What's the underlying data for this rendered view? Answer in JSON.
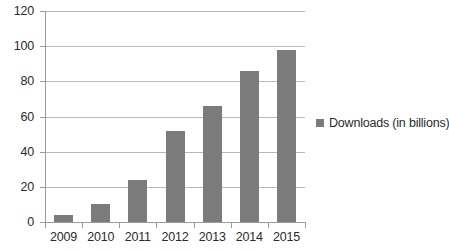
{
  "chart_data": {
    "type": "bar",
    "title": "",
    "subtitle": "",
    "xlabel": "",
    "ylabel": "",
    "categories": [
      "2009",
      "2010",
      "2011",
      "2012",
      "2013",
      "2014",
      "2015"
    ],
    "values": [
      4,
      10,
      24,
      52,
      66,
      86,
      98
    ],
    "series": [
      {
        "name": "Downloads (in billions)",
        "values": [
          4,
          10,
          24,
          52,
          66,
          86,
          98
        ],
        "color": "#7b7b7b"
      }
    ],
    "ylim": [
      0,
      120
    ],
    "yticks": [
      0,
      20,
      40,
      60,
      80,
      100,
      120
    ],
    "ytick_labels": [
      "0",
      "20",
      "40",
      "60",
      "80",
      "100",
      "120"
    ],
    "grid": true,
    "grid_axis": "y",
    "legend": {
      "position": "right",
      "entries": [
        {
          "label": "Downloads (in billions)",
          "color": "#7b7b7b"
        }
      ]
    },
    "colors": {
      "bar": "#7b7b7b",
      "gridline": "#b8b8b8",
      "axis": "#9a9a9a",
      "text": "#2b2b2b",
      "background": "#ffffff"
    }
  }
}
